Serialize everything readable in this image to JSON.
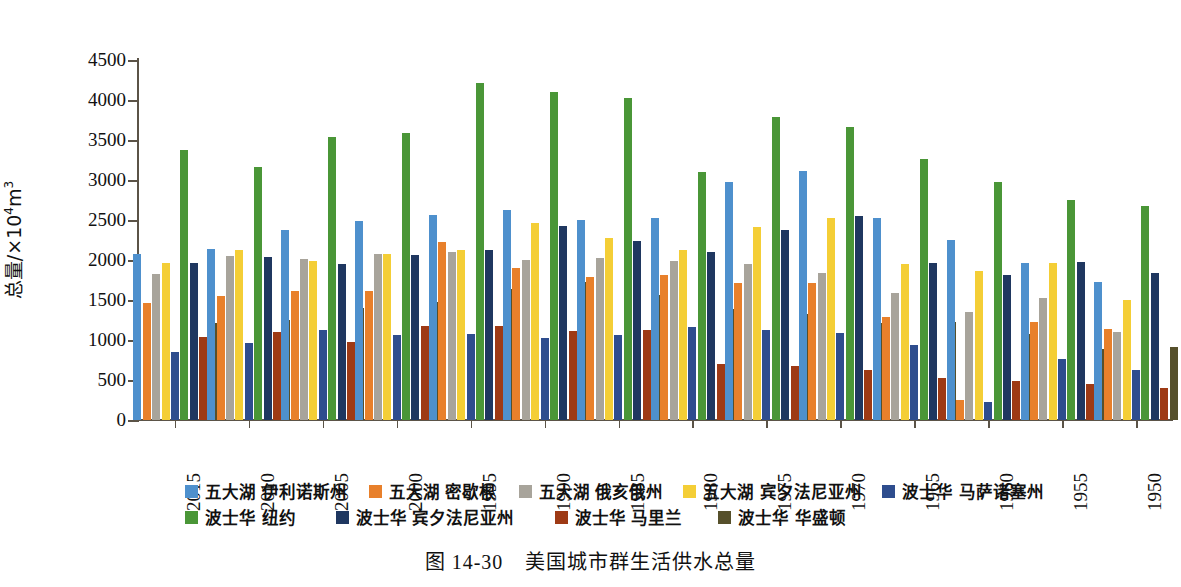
{
  "caption": {
    "figure_number": "图 14-30",
    "title": "美国城市群生活供水总量"
  },
  "axis": {
    "y_title_prefix": "总量/×10",
    "y_title_exp": "4",
    "y_title_suffix": "m",
    "y_title_suffix_exp": "3",
    "y_ticks": [
      "0",
      "500",
      "1000",
      "1500",
      "2000",
      "2500",
      "3000",
      "3500",
      "4000",
      "4500"
    ]
  },
  "legend": {
    "row1": [
      {
        "label": "五大湖 伊利诺斯州",
        "color": "#4E90CD"
      },
      {
        "label": "五大湖 密歇根",
        "color": "#E8802B"
      },
      {
        "label": "五大湖 俄亥俄州",
        "color": "#A8A49B"
      },
      {
        "label": "五大湖 宾夕法尼亚州",
        "color": "#F4CE36"
      },
      {
        "label": "波士华 马萨诸塞州",
        "color": "#2E4D8E"
      }
    ],
    "row2": [
      {
        "label": "波士华 纽约",
        "color": "#4A9637"
      },
      {
        "label": "波士华 宾夕法尼亚州",
        "color": "#1F3760"
      },
      {
        "label": "波士华 马里兰",
        "color": "#9E3A15"
      },
      {
        "label": "波士华 华盛顿",
        "color": "#56502B"
      }
    ]
  },
  "chart_data": {
    "type": "bar",
    "title": "美国城市群生活供水总量",
    "xlabel": "",
    "ylabel": "总量/×10⁴m³",
    "ylim": [
      0,
      4500
    ],
    "ytick_step": 500,
    "grid": false,
    "legend_position": "bottom",
    "categories": [
      "2015",
      "2010",
      "2005",
      "2000",
      "1995",
      "1990",
      "1985",
      "1980",
      "1975",
      "1970",
      "1965",
      "1960",
      "1955",
      "1950"
    ],
    "series": [
      {
        "name": "五大湖 伊利诺斯州",
        "color": "#4E90CD",
        "values": [
          2070,
          2140,
          2380,
          2490,
          2560,
          2620,
          2500,
          2530,
          2970,
          3110,
          2530,
          2250,
          1960,
          1730
        ]
      },
      {
        "name": "五大湖 密歇根",
        "color": "#E8802B",
        "values": [
          1460,
          1550,
          1610,
          1610,
          2220,
          1900,
          1790,
          1810,
          1710,
          1710,
          1290,
          250,
          1220,
          1140
        ]
      },
      {
        "name": "五大湖 俄亥俄州",
        "color": "#A8A49B",
        "values": [
          1830,
          2050,
          2010,
          2080,
          2100,
          2000,
          2030,
          1990,
          1950,
          1840,
          1590,
          1350,
          1520,
          1100
        ]
      },
      {
        "name": "五大湖 宾夕法尼亚州",
        "color": "#F4CE36",
        "values": [
          1960,
          2120,
          1990,
          2080,
          2130,
          2460,
          2280,
          2130,
          2410,
          2520,
          1950,
          1860,
          1960,
          1500
        ]
      },
      {
        "name": "波士华 马萨诸塞州",
        "color": "#2E4D8E",
        "values": [
          850,
          960,
          1130,
          1060,
          1070,
          1030,
          1060,
          1160,
          1120,
          1090,
          940,
          220,
          760,
          620
        ]
      },
      {
        "name": "波士华 纽约",
        "color": "#4A9637",
        "values": [
          3380,
          3160,
          3540,
          3590,
          4210,
          4100,
          4030,
          3100,
          3790,
          3660,
          3260,
          2980,
          2750,
          2670
        ]
      },
      {
        "name": "波士华 宾夕法尼亚州",
        "color": "#1F3760",
        "values": [
          1960,
          2040,
          1950,
          2060,
          2120,
          2430,
          2240,
          2100,
          2370,
          2550,
          1960,
          1810,
          1980,
          1840
        ]
      },
      {
        "name": "波士华 马里兰",
        "color": "#9E3A15",
        "values": [
          1040,
          1100,
          970,
          1180,
          1180,
          1110,
          1130,
          700,
          680,
          630,
          530,
          490,
          450,
          400
        ]
      },
      {
        "name": "波士华 华盛顿",
        "color": "#56502B",
        "values": [
          1210,
          1250,
          1400,
          1470,
          1640,
          1730,
          1560,
          1390,
          1330,
          1210,
          1220,
          1080,
          890,
          910
        ]
      }
    ]
  }
}
